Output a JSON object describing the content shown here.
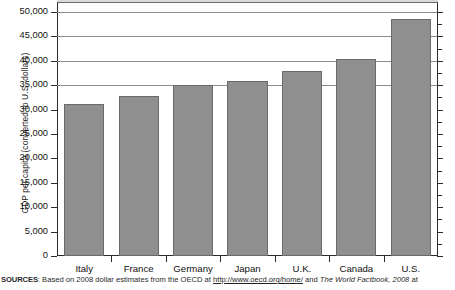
{
  "chart_data": {
    "type": "bar",
    "title": "",
    "xlabel": "",
    "ylabel": "GDP per capita (converted to U.S. dollars)",
    "categories": [
      "Italy",
      "France",
      "Germany",
      "Japan",
      "U.K.",
      "Canada",
      "U.S."
    ],
    "values": [
      31200,
      32800,
      35100,
      35800,
      37900,
      40300,
      48500
    ],
    "ylim": [
      0,
      52000
    ],
    "ytick_values": [
      0,
      5000,
      10000,
      15000,
      20000,
      25000,
      30000,
      35000,
      40000,
      45000,
      50000
    ],
    "ytick_labels": [
      "0",
      "5,000",
      "10,000",
      "15,000",
      "20,000",
      "25,000",
      "30,000",
      "35,000",
      "40,000",
      "45,000",
      "50,000"
    ],
    "gridlines_at": [
      35000,
      40000,
      45000,
      50000
    ],
    "grid": true,
    "legend": "none",
    "bar_color": "#8f8f8f",
    "bar_edge_color": "#6a6a6a",
    "axis_color": "#2b2b2b",
    "grid_color": "#8d8d8d"
  },
  "source_note": {
    "label": "SOURCES",
    "colon": ": ",
    "text_before_link": "Based on 2008 dollar estimates from the OECD at ",
    "link": "http://www.oecd.org/home/",
    "text_after_link": " and ",
    "italic_title": "The World Factbook, 2008",
    "text_end": " at"
  }
}
